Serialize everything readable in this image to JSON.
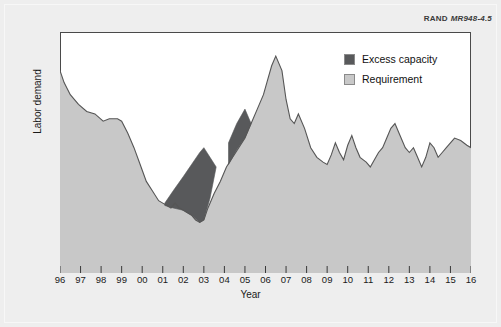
{
  "figure": {
    "credit_org": "RAND",
    "credit_code": "MR948-4.5",
    "background_color": "#eeeeee",
    "plot_background_color": "#ffffff",
    "frame_color": "#4a4a4a"
  },
  "legend": {
    "position": "top-right-inside",
    "items": [
      {
        "label": "Excess capacity",
        "color": "#58595b",
        "name": "excess-capacity"
      },
      {
        "label": "Requirement",
        "color": "#c8c8c8",
        "name": "requirement"
      }
    ]
  },
  "chart_data": {
    "type": "area",
    "title": "",
    "subtitle": "",
    "xlabel": "Year",
    "ylabel": "Labor demand",
    "grid": false,
    "legend_position": "top-right-inside",
    "annotations": [
      "RAND MR948-4.5"
    ],
    "x_tick_labels": [
      "96",
      "97",
      "98",
      "99",
      "00",
      "01",
      "02",
      "03",
      "04",
      "05",
      "06",
      "07",
      "08",
      "09",
      "10",
      "11",
      "12",
      "13",
      "14",
      "15",
      "16"
    ],
    "x": [
      1996,
      1997,
      1998,
      1999,
      2000,
      2001,
      2002,
      2003,
      2004,
      2005,
      2006,
      2007,
      2008,
      2009,
      2010,
      2011,
      2012,
      2013,
      2014,
      2015,
      2016
    ],
    "xlim": [
      1996,
      2016
    ],
    "ylim": [
      0,
      100
    ],
    "y_axis_ticks_shown": false,
    "series": [
      {
        "name": "Requirement",
        "color": "#c8c8c8",
        "x": [
          1996.0,
          1996.2,
          1996.5,
          1996.9,
          1997.3,
          1997.7,
          1998.1,
          1998.4,
          1998.8,
          1999.0,
          1999.3,
          1999.6,
          1999.9,
          2000.2,
          2000.5,
          2000.8,
          2001.0,
          2001.2,
          2001.4,
          2001.6,
          2001.8,
          2002.0,
          2002.2,
          2002.4,
          2002.6,
          2002.8,
          2003.0,
          2003.2,
          2003.5,
          2003.8,
          2004.1,
          2004.4,
          2004.7,
          2005.0,
          2005.3,
          2005.6,
          2005.9,
          2006.1,
          2006.3,
          2006.5,
          2006.8,
          2007.0,
          2007.2,
          2007.4,
          2007.6,
          2007.9,
          2008.2,
          2008.5,
          2008.8,
          2009.0,
          2009.2,
          2009.4,
          2009.6,
          2009.8,
          2010.0,
          2010.2,
          2010.4,
          2010.6,
          2010.9,
          2011.1,
          2011.3,
          2011.5,
          2011.7,
          2011.9,
          2012.1,
          2012.3,
          2012.5,
          2012.8,
          2013.0,
          2013.2,
          2013.4,
          2013.6,
          2013.8,
          2014.0,
          2014.2,
          2014.4,
          2014.6,
          2014.8,
          2015.0,
          2015.2,
          2015.5,
          2015.8,
          2016.0
        ],
        "values": [
          84,
          79,
          74,
          70,
          67,
          66,
          63,
          64,
          64,
          63,
          58,
          52,
          45,
          38,
          34,
          30,
          29,
          28,
          27,
          29,
          27,
          26,
          25,
          24,
          22,
          21,
          22,
          27,
          33,
          38,
          44,
          48,
          52,
          56,
          62,
          68,
          74,
          80,
          86,
          90,
          84,
          72,
          64,
          62,
          66,
          60,
          52,
          48,
          46,
          45,
          49,
          54,
          50,
          47,
          53,
          57,
          52,
          48,
          46,
          44,
          47,
          50,
          52,
          56,
          60,
          62,
          58,
          52,
          50,
          52,
          48,
          44,
          48,
          54,
          52,
          48,
          50,
          52,
          54,
          56,
          55,
          53,
          52
        ],
        "description": "Light gray filled area representing labor requirement over time"
      },
      {
        "name": "Excess capacity",
        "color": "#58595b",
        "regions": [
          {
            "label": "main-wedge",
            "x_start": 2001.1,
            "x_end": 2003.6,
            "upper_x": [
              2001.1,
              2001.5,
              2002.0,
              2002.4,
              2002.8,
              2003.0,
              2003.3,
              2003.6
            ],
            "upper_values": [
              29,
              34,
              40,
              45,
              50,
              52,
              48,
              44
            ],
            "lower_values": [
              28,
              27,
              26,
              24,
              21,
              22,
              31,
              44
            ]
          },
          {
            "label": "upper-wedge",
            "x_start": 2004.2,
            "x_end": 2005.3,
            "upper_x": [
              2004.2,
              2004.6,
              2005.0,
              2005.3
            ],
            "upper_values": [
              54,
              62,
              68,
              62
            ],
            "lower_values": [
              45,
              51,
              56,
              62
            ]
          }
        ],
        "description": "Dark gray wedges between capacity and requirement curves"
      }
    ]
  }
}
